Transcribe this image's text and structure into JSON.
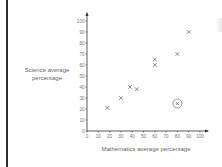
{
  "chart_data": {
    "type": "scatter",
    "title": "",
    "xlabel": "Mathematics average percentage",
    "ylabel": "Science average percentage",
    "xlim": [
      0,
      100
    ],
    "ylim": [
      0,
      100
    ],
    "x_ticks": [
      0,
      10,
      20,
      30,
      40,
      50,
      60,
      70,
      80,
      90,
      100
    ],
    "y_ticks": [
      0,
      10,
      20,
      30,
      40,
      50,
      60,
      70,
      80,
      90,
      100
    ],
    "grid": false,
    "marker": "x",
    "series": [
      {
        "name": "students",
        "points": [
          {
            "x": 18,
            "y": 21
          },
          {
            "x": 30,
            "y": 30
          },
          {
            "x": 38,
            "y": 40
          },
          {
            "x": 44,
            "y": 38
          },
          {
            "x": 60,
            "y": 65
          },
          {
            "x": 60,
            "y": 60
          },
          {
            "x": 80,
            "y": 70
          },
          {
            "x": 90,
            "y": 90
          }
        ]
      },
      {
        "name": "outlier (circled)",
        "points": [
          {
            "x": 80,
            "y": 25
          }
        ]
      }
    ],
    "annotations": [
      "Outlier point at (80, 25) is circled"
    ]
  },
  "labels": {
    "ylabel_line1": "Science average",
    "ylabel_line2": "percentage",
    "xlabel": "Mathematics average percentage"
  },
  "colors": {
    "axis": "#333333",
    "marker": "#555555",
    "text": "#777777"
  }
}
